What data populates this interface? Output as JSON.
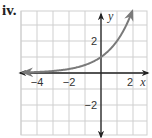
{
  "problem_label": "iv.",
  "colors": {
    "grid": "#cfcfcf",
    "axis": "#222222",
    "curve": "#7a7a7a"
  },
  "chart_data": {
    "type": "line",
    "title": "",
    "xlabel": "x",
    "ylabel": "y",
    "xlim": [
      -5,
      2.9
    ],
    "ylim": [
      -4,
      3.9
    ],
    "grid": true,
    "x_tick_labels": [
      "−4",
      "−2",
      "2"
    ],
    "x_ticks": [
      -4,
      -2,
      2
    ],
    "y_tick_labels": [
      "2",
      "−2"
    ],
    "y_ticks": [
      2,
      -2
    ],
    "series": [
      {
        "name": "y = 2^x",
        "function": "2^x",
        "x": [
          -5,
          -4,
          -3,
          -2,
          -1,
          0,
          1,
          2
        ],
        "values": [
          0.03,
          0.06,
          0.13,
          0.25,
          0.5,
          1,
          2,
          4
        ],
        "arrow_left": true,
        "arrow_right": true
      }
    ],
    "legend": null
  }
}
